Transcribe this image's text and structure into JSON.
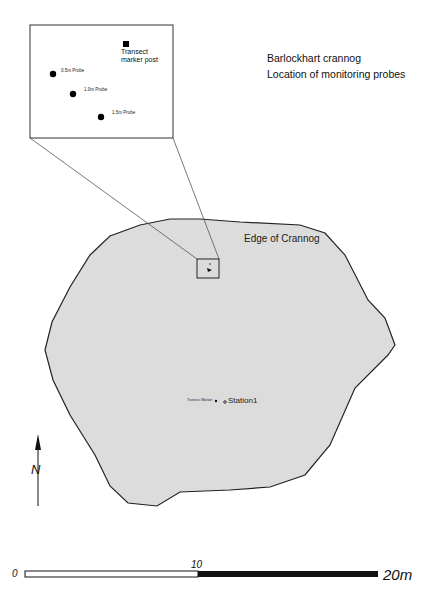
{
  "title": {
    "line1": "Barlockhart crannog",
    "line2": "Location of monitoring probes"
  },
  "colors": {
    "crannog_fill": "#dcdcdc",
    "outline": "#222222",
    "inset_border": "#333333",
    "leader_line": "#555555"
  },
  "inset": {
    "marker_label_line1": "Transect",
    "marker_label_line2": "marker post",
    "probes": [
      {
        "label": "0.5m Probe"
      },
      {
        "label": "1.0m Probe"
      },
      {
        "label": "1.5m Probe"
      }
    ]
  },
  "map": {
    "edge_label": "Edge of Crannog",
    "transect_label": "Transect Marker",
    "station_label": "Station1"
  },
  "north_arrow": {
    "label": "N"
  },
  "scale_bar": {
    "start": "0",
    "mid": "10",
    "end": "20m"
  }
}
